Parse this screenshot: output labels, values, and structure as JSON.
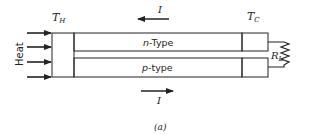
{
  "diagram": {
    "hot_side_label": "T",
    "hot_side_sub": "H",
    "cold_side_label": "T",
    "cold_side_sub": "C",
    "heat_label": "Heat",
    "n_leg_label": "n-Type",
    "n_leg_prefix": "n",
    "n_leg_suffix": "-Type",
    "p_leg_prefix": "p",
    "p_leg_suffix": "-type",
    "current_top_label": "I",
    "current_bottom_label": "I",
    "load_label": "R",
    "load_sub": "L",
    "caption": "(a)",
    "heat_arrow_count": 4,
    "current_top_direction": "left",
    "current_bottom_direction": "right",
    "colors": {
      "line": "#222222",
      "background": "#ffffff"
    }
  }
}
